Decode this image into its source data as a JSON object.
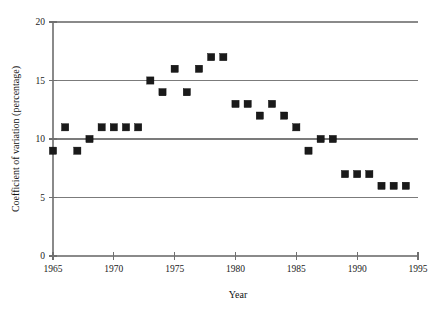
{
  "chart_data": {
    "type": "scatter",
    "title": "",
    "xlabel": "Year",
    "ylabel": "Coefficient of variation (percentage)",
    "xlim": [
      1965,
      1995
    ],
    "ylim": [
      0,
      20
    ],
    "xticks": [
      1965,
      1970,
      1975,
      1980,
      1985,
      1990,
      1995
    ],
    "xtick_labels": [
      "1965",
      "1970",
      "1975",
      "1980",
      "1985",
      "1990",
      "1995"
    ],
    "yticks": [
      0,
      5,
      10,
      15,
      20
    ],
    "ytick_labels": [
      "0",
      "5",
      "10",
      "15",
      "20"
    ],
    "gridlines_y": [
      5,
      10,
      15,
      20
    ],
    "grid": "horizontal",
    "legend": null,
    "marker_style": "filled-square",
    "marker_color": "#1a1a1a",
    "grid_color": "#7b7b7b",
    "axis_color": "#8a8a8a",
    "x": [
      1965,
      1966,
      1967,
      1968,
      1969,
      1970,
      1971,
      1972,
      1973,
      1974,
      1975,
      1976,
      1977,
      1978,
      1979,
      1980,
      1981,
      1982,
      1983,
      1984,
      1985,
      1986,
      1987,
      1988,
      1989,
      1990,
      1991,
      1992,
      1993,
      1994
    ],
    "values": [
      9,
      11,
      9,
      10,
      11,
      11,
      11,
      11,
      15,
      14,
      16,
      14,
      16,
      17,
      17,
      13,
      13,
      12,
      13,
      12,
      11,
      9,
      10,
      10,
      7,
      7,
      7,
      6,
      6,
      6
    ],
    "points": [
      {
        "year": 1965,
        "cv": 9
      },
      {
        "year": 1966,
        "cv": 11
      },
      {
        "year": 1967,
        "cv": 9
      },
      {
        "year": 1968,
        "cv": 10
      },
      {
        "year": 1969,
        "cv": 11
      },
      {
        "year": 1970,
        "cv": 11
      },
      {
        "year": 1971,
        "cv": 11
      },
      {
        "year": 1972,
        "cv": 11
      },
      {
        "year": 1973,
        "cv": 15
      },
      {
        "year": 1974,
        "cv": 14
      },
      {
        "year": 1975,
        "cv": 16
      },
      {
        "year": 1976,
        "cv": 14
      },
      {
        "year": 1977,
        "cv": 16
      },
      {
        "year": 1978,
        "cv": 17
      },
      {
        "year": 1979,
        "cv": 17
      },
      {
        "year": 1980,
        "cv": 13
      },
      {
        "year": 1981,
        "cv": 13
      },
      {
        "year": 1982,
        "cv": 12
      },
      {
        "year": 1983,
        "cv": 13
      },
      {
        "year": 1984,
        "cv": 12
      },
      {
        "year": 1985,
        "cv": 11
      },
      {
        "year": 1986,
        "cv": 9
      },
      {
        "year": 1987,
        "cv": 10
      },
      {
        "year": 1988,
        "cv": 10
      },
      {
        "year": 1989,
        "cv": 7
      },
      {
        "year": 1990,
        "cv": 7
      },
      {
        "year": 1991,
        "cv": 7
      },
      {
        "year": 1992,
        "cv": 6
      },
      {
        "year": 1993,
        "cv": 6
      },
      {
        "year": 1994,
        "cv": 6
      }
    ]
  }
}
